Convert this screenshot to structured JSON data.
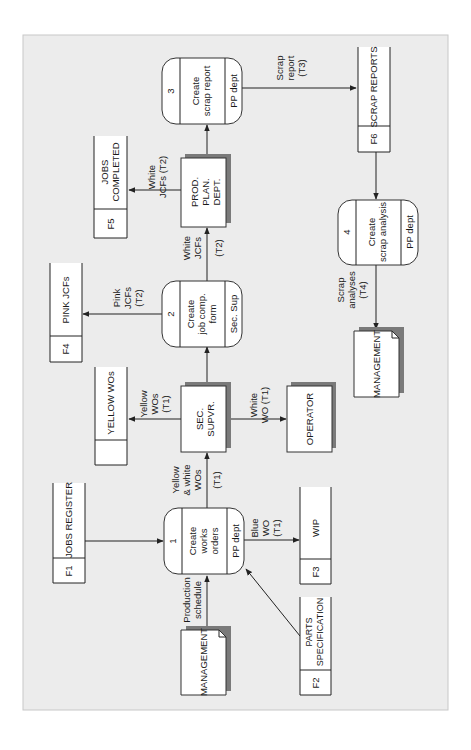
{
  "diagram": {
    "colors": {
      "background": "#ececec",
      "box": "#ffffff",
      "stroke": "#333333",
      "shadow": "#7a7a7a"
    },
    "processes": [
      {
        "id": "1",
        "lines": [
          "Create",
          "works",
          "orders"
        ],
        "location": "PP dept"
      },
      {
        "id": "2",
        "lines": [
          "Create",
          "job comp.",
          "form"
        ],
        "location": "Sec. Sup"
      },
      {
        "id": "3",
        "lines": [
          "Create",
          "scrap report"
        ],
        "location": "PP dept"
      },
      {
        "id": "4",
        "lines": [
          "Create",
          "scrap analysis"
        ],
        "location": "PP dept"
      }
    ],
    "stores": [
      {
        "id": "F1",
        "name": "JOBS REGISTER"
      },
      {
        "id": "F2",
        "name_lines": [
          "PARTS",
          "SPECIFICATION"
        ]
      },
      {
        "id": "F3",
        "name": "WIP"
      },
      {
        "id": "F4",
        "name": "PINK JCFs"
      },
      {
        "id": "F5",
        "name_lines": [
          "JOBS",
          "COMPLETED"
        ]
      },
      {
        "id": "F6",
        "name": "SCRAP REPORTS"
      },
      {
        "id": "",
        "name": "YELLOW WOs"
      }
    ],
    "entities": {
      "management_top": "MANAGEMENT",
      "management_bottom": "MANAGEMENT",
      "sec_supvr": [
        "SEC.",
        "SUPVR."
      ],
      "operator": "OPERATOR",
      "prod_plan": [
        "PROD.",
        "PLAN.",
        "DEPT."
      ]
    },
    "flows": {
      "production_schedule": [
        "Production",
        "schedule"
      ],
      "yellow_white_wos": [
        "Yellow",
        "& white",
        "WOs",
        "(T1)"
      ],
      "blue_wo": [
        "Blue",
        "WO",
        "(T1)"
      ],
      "yellow_wos": [
        "Yellow",
        "WOs",
        "(T1)"
      ],
      "white_wo": [
        "White",
        "WO (T1)"
      ],
      "pink_jcfs": [
        "Pink",
        "JCFs",
        "(T2)"
      ],
      "white_jcfs_to_plan": [
        "White",
        "JCFs",
        "(T2)"
      ],
      "white_jcfs_to_completed": [
        "White",
        "JCFs (T2)"
      ],
      "scrap_report": [
        "Scrap",
        "report",
        "(T3)"
      ],
      "scrap_analyses": [
        "Scrap",
        "analyses",
        "(T4)"
      ]
    }
  }
}
